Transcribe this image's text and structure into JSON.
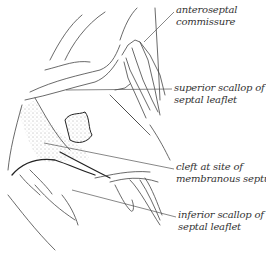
{
  "figure": {
    "type": "anatomical line illustration",
    "ink_color": "#333333",
    "background": "#ffffff",
    "labels": [
      {
        "id": "anteroseptal",
        "line1": "anteroseptal",
        "line2": "commissure",
        "x": 176,
        "y": 7,
        "target": [
          144,
          42
        ]
      },
      {
        "id": "superior-scallop",
        "line1": "superior scallop of",
        "line2": "septal leaflet",
        "x": 174,
        "y": 84,
        "target": [
          66,
          90
        ]
      },
      {
        "id": "cleft",
        "line1": "cleft at site of",
        "line2": "membranous septum",
        "x": 176,
        "y": 164,
        "target": [
          44,
          143
        ]
      },
      {
        "id": "inferior-scallop",
        "line1": "inferior scallop of",
        "line2": "septal leaflet",
        "x": 178,
        "y": 211,
        "target": [
          72,
          190
        ]
      }
    ]
  }
}
